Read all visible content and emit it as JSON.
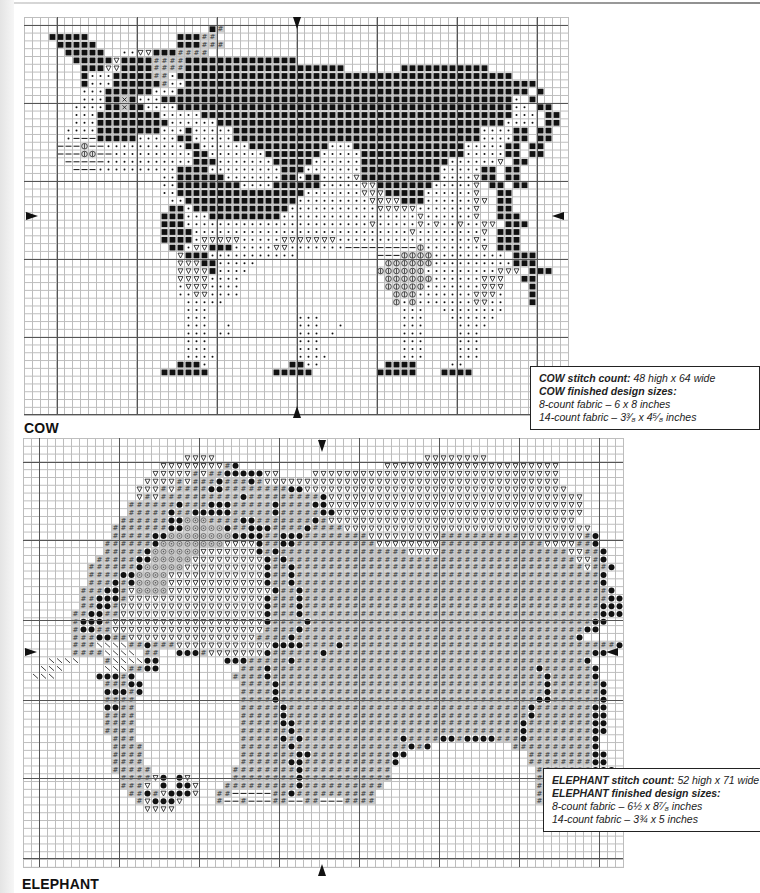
{
  "charts": [
    {
      "id": "cow",
      "caption": "COW",
      "stitch_count_label": "COW stitch count:",
      "stitch_count_value": "48 high  x  64 wide",
      "sizes_label": "COW finished design sizes:",
      "sizes": [
        "8-count fabric – 6  x  8 inches",
        "14-count fabric – 3³⁄₈  x  4⁵⁄₈ inches"
      ],
      "grid": {
        "left": 24,
        "top": 17,
        "cols": 68,
        "rows": 51,
        "cell_w": 8,
        "cell_h": 7.8
      },
      "pattern_rows": [
        "                                                                    ",
        "                       B#                                           ",
        "   BBBBB           BBB##                                            ",
        "    BBBBB          BBB###                                           ",
        "     BBBBB  ..vvBBB####                                             ",
        "      BBBBBvBBBB####BBBBBBBBBBBBBB                                 ",
        "       BBBvvBBBB####BBBBBBBBBBBBBBBBBBBB       BBBBBBBBBBB         ",
        "       B...BBBBB##.BBBBBBBBBBBBBBBBBBBBBBBBBBBBBBBBBBBBBBBBBB        ",
        "       B...BBBBBB#..BBBBBBBBBBBBBBBBBBBBBBBBBBBBBBBBBBBBBBBBBBBB     ",
        "       ...BBBBBB...BBBBBBBBBBBBBBBBBBBBBBBBBBBBBBBBBBBBBBBBBBBB B   ",
        "       ...BBxB...BBBBBBBBBBBBBBBBBBBBBBBBBBBBBBBBBBBBBBBBBBBB. B   ",
        "      ....BBxBB....BBBBBBBBBBBBBBBBBBBBBBBBBBBBBBBBBBBBBBBBBB.. BB ",
        "      ...BBBBBBBB.....BBBBBBBBBBBBBBBBBBBBBBBBBBBBBBBBBBBBBBB... BB ",
        "      ...BBBBBBBBB......BBBBBBBBBBBBBBBBBBBBBBBBBBBBBBBBBBBB.... BB ",
        "     ....BBBBBBBB...B.....BBBBBBBBBBBBBBBBBBBBBBBBBBBBBBB....BB BB ",
        "     .---BBBBB.....BB.....BBBBBBBBBBBBBBBBBBBBBBBBBBBBBBB....BB BB ",
        "    ---t--..........BB......BBBBBBBBBB...BBBBBBBBBBBBBB.....BB BB ",
        "    ---tt--..........BB.......BBBBBBB.....BBBBBBBBBBBBB.....BB BB ",
        "     -----...........BBB.......BBBBB......BBBBBBBBBBB......v BB ",
        "      ---..........BBBB.........BBB.......BBBBBBBBBB.....BB BB  ",
        "                 ..BBBBBB.......BB.BB....vBBBBBBBBBB....vBB BB  ",
        "                 ..BBBBBBBB....BBBBBB.....vvBBBBBBB.....v BB BB ",
        "                 ..BBBBBBBBBBBBBBBB.......vvvBBBBB......v  BB  ",
        "                  ..BBBBBBBBBBBBBB.........vvvvBBB......vv BB  ",
        "                  BB.BBBBBBBBBBBB...........vvvvv.......v  BB  ",
        "                 BBB...BBBBBBBBB.................v......v  BBB ",
        "                 BBB.......................v.....v.v..v..vv BBB ",
        "                 BBBB...........................v........v BBB ",
        "                 BBBB.vvvvv.....vvvvvvv.................v. BBB ",
        "                  BB.vvBBB.....vv.......---------t.......v BBB ",
        "                   vBBB...........          ---tttt......... BBB ",
        "                   vvvBB.....                tttttt..........BBB ",
        "                   vvvvB....                tttttt.........vvv BBB",
        "                   vvvv....                  tttttt......vvv  BB ",
        "                   .vvv....                  ttttt.......vvv   B ",
        "                   ..vv....                   ttt.......vvv.   B ",
        "                    .....                     t.t.......vv..   B ",
        "                    ...                        ...  ........      ",
        "                    ...           ...          ...   ......       ",
        "                    ...  .        ...  .       ...    ....        ",
        "                    ... ..        ... .        ...    ...         ",
        "                    ...           ...          ...    ...         ",
        "                    ...           ...          ...    ...         ",
        "                    ....          ....         ...    ...         ",
        "                   BBB.          BB..        BBBB    ..          ",
        "                 BBBBBB        BBBBB        BBBBB   BBBB         ",
        "                                                                    ",
        "                                                                    ",
        "                                                                    ",
        "                                                                    ",
        "                                                                    "
      ],
      "heavy_lines": {
        "v": [
          57,
          137,
          217,
          297,
          377,
          457,
          537
        ],
        "h": [
          25,
          103,
          181,
          259,
          337,
          414
        ]
      },
      "arrows": [
        {
          "dir": "down",
          "x": 293,
          "y": 17
        },
        {
          "dir": "up",
          "x": 293,
          "y": 406
        },
        {
          "dir": "right",
          "x": 26,
          "y": 212
        },
        {
          "dir": "left",
          "x": 552,
          "y": 212
        }
      ],
      "infobox": {
        "left": 530,
        "top": 366,
        "width": 212
      }
    },
    {
      "id": "elephant",
      "caption": "ELEPHANT",
      "stitch_count_label": "ELEPHANT stitch count:",
      "stitch_count_value": "52 high  x  71 wide",
      "sizes_label": "ELEPHANT finished design sizes:",
      "sizes": [
        "8-count fabric – 6½  x  8⁷⁄₈ inches",
        "14-count fabric – 3¾  x  5 inches"
      ],
      "grid": {
        "left": 23,
        "top": 438,
        "cols": 75,
        "rows": 55,
        "cell_w": 8,
        "cell_h": 7.8
      },
      "pattern_rows": [
        "                                                                           ",
        "                                                                           ",
        "                    vvvv                          vvvvvvvv                 ",
        "                 vvvvvvvv#o                  vvvvvvvvvvvvvvvvvvvvvv        ",
        "                vvvvv#v##ooooovv    vvvvvvvvvvvvvvvvvvvvvvvvvvvvvvv        ",
        "               vvvv#v###o###o#vvvvvvvvvvvvvvvvvvvvvvvvvvvvvvvvvvvvv       ",
        "              vvv#v####oo########oovvvvvvvvvvvvvvvvvvvvvvvvvvvvvvvvv       ",
        "              v#v##########o#########ovvvvvvvvvvvvvvvvvvvvvvvvvvvvvvvv      ",
        "             ######o###ooo#####o####oovvvvvvvvvvvvvvvvvvvvvvvvvvvvvvvv     ",
        "             #####o##ooooo#####o#####oovvvvvvvvvvvvvvvvvvvvvvvvvvvvvvv     ",
        "            ######ooddd####oo#######o#vvvvvvvvvvvvvvvvvvvvvvvvvvvvvvv     ",
        "           #######oodddddo##ooo####o####vvvvvvvvvvvvvvvvvvvvvvvvvvvvvvv    ",
        "           #####ooddddddddoooo##ooo########vvvvvvvvv##########vvvvvvvv#o   ",
        "          ######oddddddddvvvvo##oo##########vvvvvvvv#############vvvv##o   ",
        "          #####oddddddvvvvvvvo#o################vvvv################vv##o  ",
        "         #####oodddddvvvvvvvvvo#o####################################vv#o  ",
        "        ######odddddvvvvvvvvvvo##o####################################v##o ",
        "        ####ooddddvvvvvvvvvvvvo##o######################################o ",
        "        ###o#oddddvvvvvvvvvvvvo##o######################################o ",
        "       ###oo#vddddvvvvvvvvvvvvvo##o######################################o ",
        "       ##ooo#vvvvvvvvvvvvvvvvvo###o######################################oo",
        "       ##oo#vvvvvvvvvvvvvvvvvvo###o#####################################ooo",
        "      ##oo##vvvvvvvvvvvvvvvvvvo###o#####################################ooo",
        "      #ooo#vvvvvvvvvvvvvvvvvvvo####o###################################oo  ",
        "      #oo##vvvvvvvvvvvvvvvvvvv####o###################################oo   ",
        "      ###oo##vvvvvvvvvvvvvvvv####o###################################o    ",
        "      ###\\\\\\\\##o###vvvvvvvvvvvvoooo####o##################################o    ",
        "      ####\\\\\\\\ ##  ooo#vvvvvvvo######o#################################oo    ",
        "   \\\\\\\\   #\\\\\\\\oo        ooo#####o####################################o     ",
        "  \\\\\\     \\\\\\##oo          ###o#################################o######o     ",
        " \\\\\\     ooo#o            ####o##################################o#####o     ",
        "          ###oo            ####o#################################o######o     ",
        "          ooo#o            ####o#################################o######o     ",
        "          ####             ####o################################oo######o     ",
        "          oo##             #####o##############################o#######oo    ",
        "          ####             #####o##############################o#######oo    ",
        "          ####             #####oo############################o########oo    ",
        "          ####             ######o############################o########oo    ",
        "           ###             #####o#o############o####oo#oooo###o########o     ",
        "           ####            ######o##############o#o          ##########o     ",
        "           ####            #######oo##########oo               ########oo    ",
        "           ####            ######oo###########o                ########oo    ",
        "           #####          ########o###########                  #######ooo   ",
        "            ####vo ov     ########o###########                  ######oo      ",
        "            ###v o oov   #########o##########                   ##########ooo ",
        "             ##o#vooov  ##-----##o##########                    #-#--###oooo  ",
        "              #vooov    #--#---##--##---####                    #--#---##oooo ",
        "               vvvv                                                        ",
        "                                                                           ",
        "                                                                           ",
        "                                                                           ",
        "                                                                           "
      ],
      "heavy_lines": {
        "v": [
          39,
          119,
          199,
          279,
          359,
          439,
          519,
          599
        ],
        "h": [
          462,
          540,
          620,
          700,
          778,
          858
        ]
      },
      "arrows": [
        {
          "dir": "down",
          "x": 318,
          "y": 440
        },
        {
          "dir": "up",
          "x": 318,
          "y": 864
        },
        {
          "dir": "right",
          "x": 25,
          "y": 648
        },
        {
          "dir": "left",
          "x": 606,
          "y": 648
        }
      ],
      "infobox": {
        "left": 543,
        "top": 768,
        "width": 205
      }
    }
  ],
  "symbols": {
    "B": "black-square",
    ".": "dot",
    "v": "open-triangle",
    "#": "hash-on-gray",
    "o": "filled-circle",
    "d": "diamond-dot-on-gray",
    "-": "dash",
    "t": "theta-circle",
    "x": "x-box",
    "\\": "backslash"
  },
  "colors": {
    "ink": "#111111",
    "gray_fill": "#c9c9c9",
    "grid_light": "#bdbdbd",
    "grid_heavy": "#555555"
  }
}
